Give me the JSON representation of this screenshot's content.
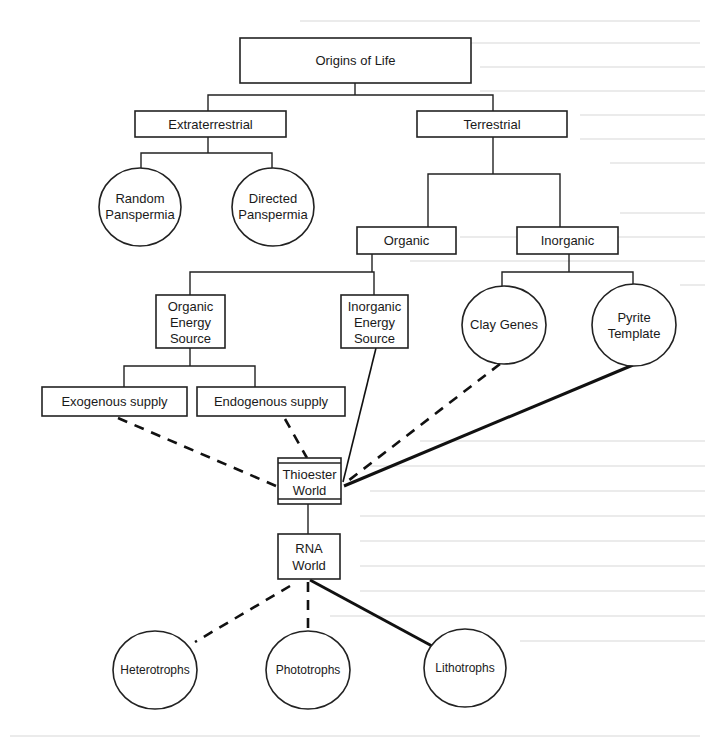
{
  "diagram": {
    "title": "Origins of Life",
    "nodes": {
      "origins": {
        "label": "Origins of Life",
        "shape": "box"
      },
      "extraterrestrial": {
        "label": "Extraterrestrial",
        "shape": "box"
      },
      "terrestrial": {
        "label": "Terrestrial",
        "shape": "box"
      },
      "random_panspermia": {
        "label_line1": "Random",
        "label_line2": "Panspermia",
        "shape": "circle"
      },
      "directed_panspermia": {
        "label_line1": "Directed",
        "label_line2": "Panspermia",
        "shape": "circle"
      },
      "organic": {
        "label": "Organic",
        "shape": "box"
      },
      "inorganic": {
        "label": "Inorganic",
        "shape": "box"
      },
      "organic_energy_source": {
        "label_line1": "Organic",
        "label_line2": "Energy",
        "label_line3": "Source",
        "shape": "box"
      },
      "inorganic_energy_source": {
        "label_line1": "Inorganic",
        "label_line2": "Energy",
        "label_line3": "Source",
        "shape": "box"
      },
      "clay_genes": {
        "label": "Clay Genes",
        "shape": "circle"
      },
      "pyrite_template": {
        "label_line1": "Pyrite",
        "label_line2": "Template",
        "shape": "circle"
      },
      "exogenous_supply": {
        "label": "Exogenous supply",
        "shape": "box"
      },
      "endogenous_supply": {
        "label": "Endogenous supply",
        "shape": "box"
      },
      "thioester_world": {
        "label_line1": "Thioester",
        "label_line2": "World",
        "shape": "double-bar-box"
      },
      "rna_world": {
        "label_line1": "RNA",
        "label_line2": "World",
        "shape": "box"
      },
      "heterotrophs": {
        "label": "Heterotrophs",
        "shape": "circle"
      },
      "phototrophs": {
        "label": "Phototrophs",
        "shape": "circle"
      },
      "lithotrophs": {
        "label": "Lithotrophs",
        "shape": "circle"
      }
    },
    "edges": [
      {
        "from": "origins",
        "to": "extraterrestrial",
        "style": "tree"
      },
      {
        "from": "origins",
        "to": "terrestrial",
        "style": "tree"
      },
      {
        "from": "extraterrestrial",
        "to": "random_panspermia",
        "style": "tree"
      },
      {
        "from": "extraterrestrial",
        "to": "directed_panspermia",
        "style": "tree"
      },
      {
        "from": "terrestrial",
        "to": "organic",
        "style": "tree"
      },
      {
        "from": "terrestrial",
        "to": "inorganic",
        "style": "tree"
      },
      {
        "from": "organic",
        "to": "organic_energy_source",
        "style": "tree"
      },
      {
        "from": "organic",
        "to": "inorganic_energy_source",
        "style": "tree"
      },
      {
        "from": "inorganic",
        "to": "clay_genes",
        "style": "tree"
      },
      {
        "from": "inorganic",
        "to": "pyrite_template",
        "style": "tree"
      },
      {
        "from": "organic_energy_source",
        "to": "exogenous_supply",
        "style": "tree"
      },
      {
        "from": "organic_energy_source",
        "to": "endogenous_supply",
        "style": "tree"
      },
      {
        "from": "exogenous_supply",
        "to": "thioester_world",
        "style": "dashed"
      },
      {
        "from": "endogenous_supply",
        "to": "thioester_world",
        "style": "dashed"
      },
      {
        "from": "inorganic_energy_source",
        "to": "thioester_world",
        "style": "solid"
      },
      {
        "from": "clay_genes",
        "to": "thioester_world",
        "style": "dashed"
      },
      {
        "from": "pyrite_template",
        "to": "thioester_world",
        "style": "solid-thick"
      },
      {
        "from": "thioester_world",
        "to": "rna_world",
        "style": "tree"
      },
      {
        "from": "rna_world",
        "to": "heterotrophs",
        "style": "dashed"
      },
      {
        "from": "rna_world",
        "to": "phototrophs",
        "style": "dashed"
      },
      {
        "from": "rna_world",
        "to": "lithotrophs",
        "style": "solid-thick"
      }
    ]
  }
}
